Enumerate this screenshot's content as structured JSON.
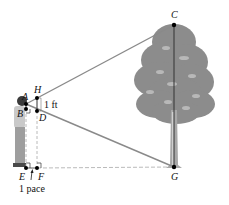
{
  "figure": {
    "points": {
      "A": {
        "label": "A",
        "x": 26,
        "y": 104
      },
      "B": {
        "label": "B",
        "x": 26,
        "y": 109
      },
      "H": {
        "label": "H",
        "x": 37,
        "y": 98
      },
      "D": {
        "label": "D",
        "x": 37,
        "y": 111
      },
      "E": {
        "label": "E",
        "x": 26,
        "y": 168
      },
      "F": {
        "label": "F",
        "x": 37,
        "y": 168
      },
      "C": {
        "label": "C",
        "x": 174,
        "y": 25
      },
      "G": {
        "label": "G",
        "x": 174,
        "y": 167
      }
    },
    "annotations": {
      "hd_length": "1 ft",
      "ef_length": "1 pace"
    },
    "colors": {
      "line": "#8a8a8a",
      "dashed": "#a8a8a8",
      "tree": "#8c8c8c",
      "point": "#000000"
    }
  }
}
